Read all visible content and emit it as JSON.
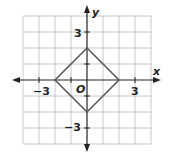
{
  "diagram": {
    "x_label": "x",
    "y_label": "y",
    "origin_label": "O",
    "tick_labels": {
      "x_neg": "−3",
      "x_pos": "3",
      "y_pos": "3",
      "y_neg": "−3"
    },
    "grid_range": [
      -4,
      4
    ],
    "shape": "square (rotated)",
    "vertices": [
      [
        0,
        2
      ],
      [
        2,
        0
      ],
      [
        0,
        -2
      ],
      [
        -2,
        0
      ]
    ],
    "colors": {
      "grid": "#c8c8c8",
      "axis": "#222222",
      "shape": "#555555"
    }
  }
}
